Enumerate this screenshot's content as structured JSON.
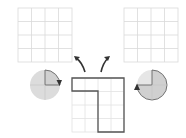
{
  "diagram": {
    "colors": {
      "background": "#ffffff",
      "grid_line": "#d9d9d9",
      "shape_outline": "#555555",
      "circle_fill": "#dcdcdc",
      "circle_highlight": "#c8c8c8",
      "arrow": "#333333"
    },
    "grids": [
      {
        "id": "left",
        "x": 18,
        "y": 8,
        "size": 54,
        "rows": 4,
        "cols": 4
      },
      {
        "id": "right",
        "x": 124,
        "y": 8,
        "size": 54,
        "rows": 4,
        "cols": 4
      },
      {
        "id": "center",
        "x": 72,
        "y": 78,
        "size": 53,
        "rows": 4,
        "cols": 4
      }
    ],
    "circles": [
      {
        "id": "left",
        "cx": 45,
        "cy": 85,
        "r": 15,
        "rotation": "90° clockwise",
        "highlighted_quadrants": [
          "top-right"
        ]
      },
      {
        "id": "right",
        "cx": 152,
        "cy": 85,
        "r": 15,
        "rotation": "270° clockwise",
        "highlighted_quadrants": [
          "top-right",
          "bottom-right",
          "bottom-left"
        ]
      }
    ],
    "center_shape": "inverted L",
    "arrows": [
      "curved arrow to left grid",
      "curved arrow to right grid"
    ]
  }
}
